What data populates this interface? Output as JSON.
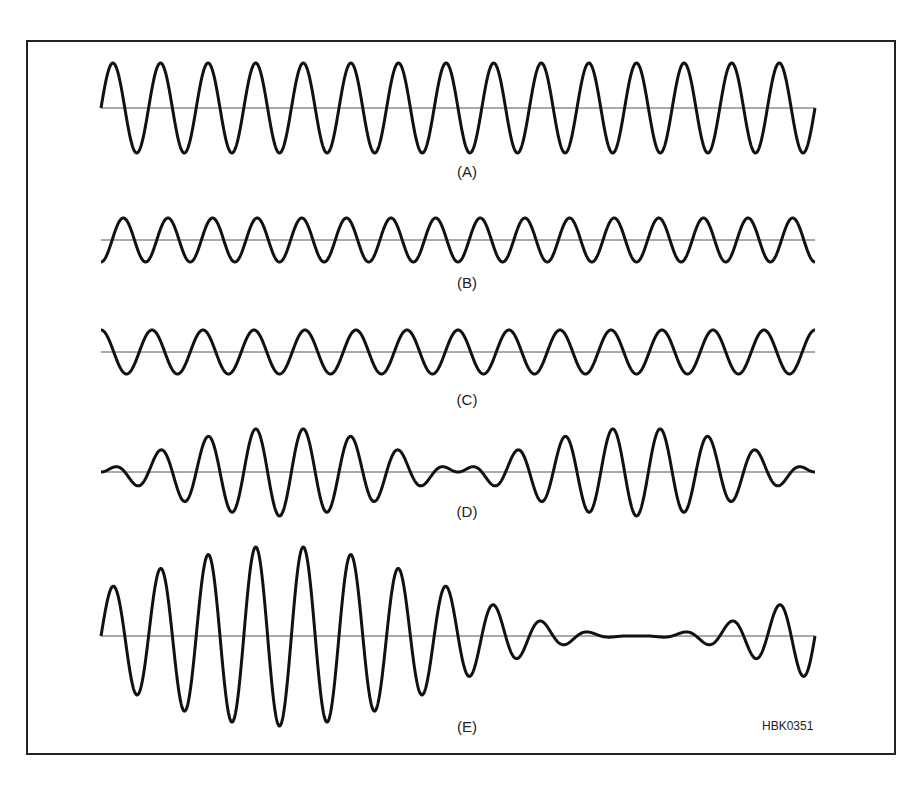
{
  "figure": {
    "id_label": "HBK0351",
    "frame": {
      "left": 26,
      "top": 40,
      "right": 894,
      "bottom": 753
    },
    "x_start": 101,
    "x_end": 815,
    "stroke_color": "#111111",
    "axis_color": "#555555"
  },
  "panels": [
    {
      "key": "A",
      "label": "(A)",
      "baseline_y": 108,
      "label_y": 172,
      "description": "Sine wave, 15 cycles, large amplitude",
      "components": [
        {
          "cycles": 15,
          "amp": 45,
          "phase": 0
        }
      ]
    },
    {
      "key": "B",
      "label": "(B)",
      "baseline_y": 240,
      "label_y": 283,
      "description": "Sine wave, 16 cycles, smaller amplitude",
      "components": [
        {
          "cycles": 16,
          "amp": 22,
          "phase": -1.5708
        }
      ]
    },
    {
      "key": "C",
      "label": "(C)",
      "baseline_y": 352,
      "label_y": 400,
      "description": "Sine wave, 14 cycles, smaller amplitude",
      "components": [
        {
          "cycles": 14,
          "amp": 22,
          "phase": 1.5708
        }
      ]
    },
    {
      "key": "D",
      "label": "(D)",
      "baseline_y": 472,
      "label_y": 512,
      "description": "Sum of B and C: beat pattern with two envelope peaks",
      "components": [
        {
          "cycles": 16,
          "amp": 22,
          "phase": -1.5708
        },
        {
          "cycles": 14,
          "amp": 22,
          "phase": 1.5708
        }
      ]
    },
    {
      "key": "E",
      "label": "(E)",
      "baseline_y": 636,
      "label_y": 727,
      "description": "Sum of A, B and C: single envelope max then near-null",
      "components": [
        {
          "cycles": 15,
          "amp": 45,
          "phase": 0
        },
        {
          "cycles": 16,
          "amp": 22.5,
          "phase": -1.5708
        },
        {
          "cycles": 14,
          "amp": 22.5,
          "phase": 1.5708
        }
      ]
    }
  ],
  "chart_data": {
    "type": "line",
    "title": "",
    "xlabel": "time",
    "ylabel": "amplitude",
    "series": [
      {
        "name": "(A)",
        "frequency_cycles": 15,
        "relative_amplitude": 1.0
      },
      {
        "name": "(B)",
        "frequency_cycles": 16,
        "relative_amplitude": 0.5
      },
      {
        "name": "(C)",
        "frequency_cycles": 14,
        "relative_amplitude": 0.5
      },
      {
        "name": "(D)",
        "formula": "B + C",
        "envelope_peaks": 2
      },
      {
        "name": "(E)",
        "formula": "A + B + C",
        "envelope_peaks": 1
      }
    ],
    "grid": false,
    "legend": "none",
    "annotation": "HBK0351"
  }
}
